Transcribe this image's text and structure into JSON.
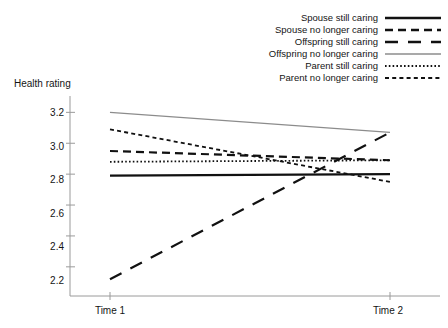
{
  "chart_data": {
    "type": "line",
    "title": "",
    "xlabel": "",
    "ylabel": "Health rating",
    "x": [
      "Time 1",
      "Time 2"
    ],
    "categories": [
      "Time 1",
      "Time 2"
    ],
    "ylim": [
      2.05,
      3.28
    ],
    "yticks": [
      2.2,
      2.4,
      2.6,
      2.8,
      3.0,
      3.2
    ],
    "ytick_labels": [
      "2.2",
      "2.4",
      "2.6",
      "2.8",
      "3.0",
      "3.2"
    ],
    "grid": false,
    "legend_position": "top-right",
    "series": [
      {
        "name": "Spouse still caring",
        "values": [
          2.79,
          2.8
        ],
        "style": "solid",
        "color": "#111111",
        "width": 2.2
      },
      {
        "name": "Spouse no longer caring",
        "values": [
          2.95,
          2.89
        ],
        "style": "dashed",
        "color": "#111111",
        "width": 2.2
      },
      {
        "name": "Offspring still caring",
        "values": [
          2.12,
          3.07
        ],
        "style": "longdash",
        "color": "#111111",
        "width": 2.2
      },
      {
        "name": "Offspring no longer caring",
        "values": [
          3.2,
          3.07
        ],
        "style": "thin-solid",
        "color": "#8c8c8c",
        "width": 1.2
      },
      {
        "name": "Parent still caring",
        "values": [
          2.88,
          2.89
        ],
        "style": "dotted",
        "color": "#111111",
        "width": 1.8
      },
      {
        "name": "Parent no longer caring",
        "values": [
          3.09,
          2.75
        ],
        "style": "dashdot",
        "color": "#111111",
        "width": 1.8
      }
    ]
  },
  "axis": {
    "y_title": "Health rating",
    "y_tick_labels": [
      "3.2",
      "3.0",
      "2.8",
      "2.6",
      "2.4",
      "2.2"
    ],
    "x_tick_labels": [
      "Time 1",
      "Time 2"
    ]
  },
  "legend": {
    "items": [
      {
        "label": "Spouse still caring"
      },
      {
        "label": "Spouse no longer caring"
      },
      {
        "label": "Offspring still caring"
      },
      {
        "label": "Offspring no longer caring"
      },
      {
        "label": "Parent still caring"
      },
      {
        "label": "Parent no longer caring"
      }
    ]
  }
}
